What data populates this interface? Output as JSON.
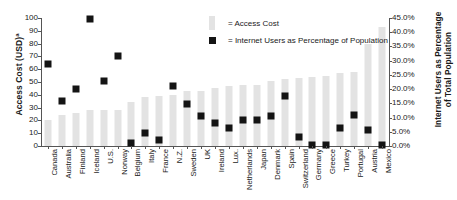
{
  "chart_data": {
    "type": "bar",
    "title": "",
    "xlabel": "",
    "ylabel": "Access Cost (USD)",
    "ylabel_superscript": "a",
    "y2label": "Internet Users as Percentage of Total Population",
    "ylim": [
      0,
      100
    ],
    "y2lim": [
      0,
      45
    ],
    "yticks": [
      "0",
      "10",
      "20",
      "30",
      "40",
      "50",
      "60",
      "70",
      "80",
      "90",
      "100"
    ],
    "y2ticks": [
      "0.0%",
      "5.0%",
      "10.0%",
      "15.0%",
      "20.0%",
      "25.0%",
      "30.0%",
      "35.0%",
      "40.0%",
      "45.0%"
    ],
    "grid": false,
    "legend_position": "top-center",
    "categories": [
      "Canada",
      "Australia",
      "Finland",
      "Iceland",
      "U.S.",
      "Norway",
      "Belgium",
      "Italy",
      "France",
      "N.Z.",
      "Sweden",
      "UK",
      "Ireland",
      "Lux.",
      "Netherlands",
      "Japan",
      "Denmark",
      "Spain",
      "Switzerland",
      "Germany",
      "Greece",
      "Turkey",
      "Portugal",
      "Austria",
      "Mexico"
    ],
    "series": [
      {
        "name": "Access Cost",
        "unit": "USD",
        "axis": "left",
        "type": "bar",
        "color": "#e3e3e3",
        "values": [
          20,
          24,
          26,
          28,
          28,
          28,
          34,
          38,
          39,
          40,
          43,
          43,
          45,
          47,
          48,
          48,
          51,
          52,
          53,
          54,
          55,
          57,
          58,
          80,
          93
        ]
      },
      {
        "name": "Internet Users as Percentage of Population",
        "unit": "%",
        "axis": "right",
        "type": "scatter",
        "color": "#141414",
        "values": [
          28.8,
          15.8,
          20.0,
          44.5,
          22.9,
          31.5,
          1.0,
          4.5,
          2.0,
          21.0,
          14.9,
          10.5,
          8.0,
          6.5,
          9.3,
          9.3,
          10.5,
          17.5,
          3.0,
          0.5,
          0.2,
          6.5,
          10.8,
          5.5,
          0.2
        ]
      }
    ],
    "legend": [
      {
        "label": "= Access Cost",
        "marker": "bar",
        "color": "#e3e3e3"
      },
      {
        "label": "= Internet Users as Percentage of Population",
        "marker": "square",
        "color": "#141414"
      }
    ]
  }
}
